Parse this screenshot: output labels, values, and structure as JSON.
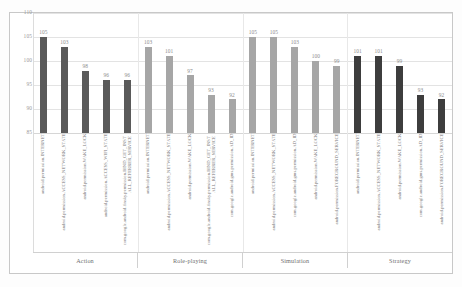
{
  "chart_data": {
    "type": "bar",
    "title": "",
    "xlabel": "",
    "ylabel": "",
    "ylim": [
      85,
      110
    ],
    "yticks": [
      110,
      105,
      100,
      95,
      90,
      85
    ],
    "grid": true,
    "legend": "none",
    "groups": [
      {
        "name": "Action",
        "color": "#5a5a5a",
        "categories": [
          "android.permission.INTERNET",
          "android.permission.ACCESS_NETWORK_STATE",
          "android.permission.WAKE_LOCK",
          "android.permission.ACCESS_WIFI_STATE",
          "com.google.android.finsky.permission.BIND_GET_INSTALL_REFERRER_SERVICE"
        ],
        "values": [
          105,
          103,
          98,
          96,
          96
        ]
      },
      {
        "name": "Role-playing",
        "color": "#a6a6a6",
        "categories": [
          "android.permission.INTERNET",
          "android.permission.ACCESS_NETWORK_STATE",
          "android.permission.WAKE_LOCK",
          "com.google.android.finsky.permission.BIND_GET_INSTALL_REFERRER_SERVICE",
          "com.google.android.gms.permission.AD_ID"
        ],
        "values": [
          103,
          101,
          97,
          93,
          92
        ]
      },
      {
        "name": "Simulation",
        "color": "#a6a6a6",
        "categories": [
          "android.permission.INTERNET",
          "android.permission.ACCESS_NETWORK_STATE",
          "com.google.android.gms.permission.AD_ID",
          "android.permission.WAKE_LOCK",
          "android.permission.FOREGROUND_SERVICE"
        ],
        "values": [
          105,
          105,
          103,
          100,
          99
        ]
      },
      {
        "name": "Strategy",
        "color": "#3d3d3d",
        "categories": [
          "android.permission.INTERNET",
          "android.permission.ACCESS_NETWORK_STATE",
          "android.permission.WAKE_LOCK",
          "com.google.android.gms.permission.AD_ID",
          "android.permission.FOREGROUND_SERVICE"
        ],
        "values": [
          101,
          101,
          99,
          93,
          92
        ]
      }
    ]
  }
}
